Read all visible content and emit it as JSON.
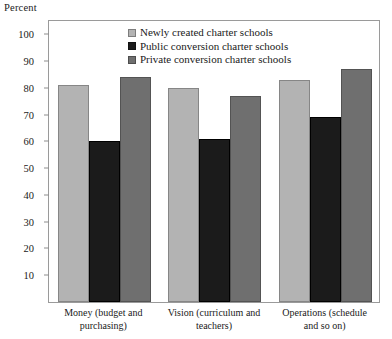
{
  "chart_data": {
    "type": "bar",
    "title": "",
    "ylabel": "Percent",
    "xlabel": "",
    "ylim": [
      0,
      105
    ],
    "yticks": [
      10,
      20,
      30,
      40,
      50,
      60,
      70,
      80,
      90,
      100
    ],
    "grid": false,
    "legend_position": "top-center",
    "categories": [
      "Money (budget and\npurchasing)",
      "Vision (curriculum and\nteachers)",
      "Operations (schedule\nand so on)"
    ],
    "series": [
      {
        "name": "Newly created charter schools",
        "color": "#b3b3b3",
        "values": [
          81,
          80,
          83
        ]
      },
      {
        "name": "Public conversion charter schools",
        "color": "#1b1b1b",
        "values": [
          60,
          61,
          69
        ]
      },
      {
        "name": "Private conversion charter schools",
        "color": "#6f6f6f",
        "values": [
          84,
          77,
          87
        ]
      }
    ]
  }
}
